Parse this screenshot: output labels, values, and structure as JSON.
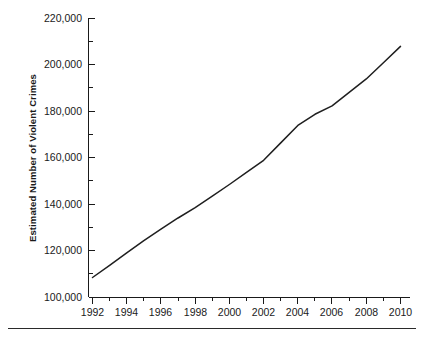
{
  "chart_data": {
    "type": "line",
    "title": "",
    "xlabel": "",
    "ylabel": "Estimated Number of Violent Crimes",
    "xlim": [
      1992,
      2010
    ],
    "ylim": [
      100000,
      220000
    ],
    "grid": false,
    "legend": null,
    "x": [
      1992,
      1993,
      1994,
      1995,
      1996,
      1997,
      1998,
      1999,
      2000,
      2001,
      2002,
      2003,
      2004,
      2005,
      2006,
      2007,
      2008,
      2009,
      2010
    ],
    "series": [
      {
        "name": "Estimated Number of Violent Crimes",
        "color": "#1f1f1f",
        "values": [
          108600,
          113800,
          119200,
          124500,
          129400,
          134200,
          138700,
          143600,
          148600,
          153800,
          159000,
          166500,
          174000,
          178800,
          182400,
          188200,
          194000,
          201000,
          208000
        ]
      }
    ],
    "y_ticks_major": [
      100000,
      120000,
      140000,
      160000,
      180000,
      200000,
      220000
    ],
    "y_tick_labels": [
      "100,000",
      "120,000",
      "140,000",
      "160,000",
      "180,000",
      "200,000",
      "220,000"
    ],
    "y_ticks_minor": [
      110000,
      130000,
      150000,
      170000,
      190000,
      210000
    ],
    "x_ticks_major": [
      1992,
      1994,
      1996,
      1998,
      2000,
      2002,
      2004,
      2006,
      2008,
      2010
    ],
    "x_tick_labels": [
      "1992",
      "1994",
      "1996",
      "1998",
      "2000",
      "2002",
      "2004",
      "2006",
      "2008",
      "2010"
    ],
    "x_ticks_minor": [
      1993,
      1995,
      1997,
      1999,
      2001,
      2003,
      2005,
      2007,
      2009
    ]
  },
  "axis": {
    "ylabel": "Estimated Number of Violent Crimes",
    "ytick_0": "100,000",
    "ytick_1": "120,000",
    "ytick_2": "140,000",
    "ytick_3": "160,000",
    "ytick_4": "180,000",
    "ytick_5": "200,000",
    "ytick_6": "220,000",
    "xtick_0": "1992",
    "xtick_1": "1994",
    "xtick_2": "1996",
    "xtick_3": "1998",
    "xtick_4": "2000",
    "xtick_5": "2002",
    "xtick_6": "2004",
    "xtick_7": "2006",
    "xtick_8": "2008",
    "xtick_9": "2010"
  }
}
